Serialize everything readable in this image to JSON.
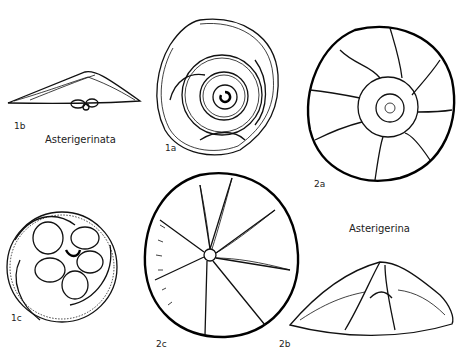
{
  "plate": {
    "figures": [
      {
        "id": "1a",
        "label": "1a",
        "view": "spiral side"
      },
      {
        "id": "1b",
        "label": "1b",
        "view": "edge view"
      },
      {
        "id": "1c",
        "label": "1c",
        "view": "umbilical side"
      },
      {
        "id": "2a",
        "label": "2a",
        "view": "spiral side"
      },
      {
        "id": "2b",
        "label": "2b",
        "view": "edge view"
      },
      {
        "id": "2c",
        "label": "2c",
        "view": "umbilical side"
      }
    ],
    "genera": [
      {
        "name": "Asterigerinata"
      },
      {
        "name": "Asterigerina"
      }
    ]
  }
}
